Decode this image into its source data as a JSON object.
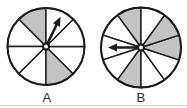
{
  "figure": {
    "background": "#ffffff",
    "ink_color": "#1c1c1c",
    "shade_color": "#c3c3c3",
    "spinners": [
      {
        "label": "A",
        "cx": 46,
        "cy": 46.5,
        "r": 38.5,
        "num_sectors": 8,
        "sector_start_deg": 90,
        "shaded_sector_indices": [
          0,
          4
        ],
        "arrow": {
          "angle_deg": 64,
          "length": 33
        }
      },
      {
        "label": "B",
        "cx": 141,
        "cy": 47.5,
        "r": 40,
        "num_sectors": 10,
        "sector_start_deg": 90,
        "shaded_sector_indices": [
          0,
          4,
          7,
          8
        ],
        "arrow": {
          "angle_deg": 180,
          "length": 33
        }
      }
    ]
  }
}
